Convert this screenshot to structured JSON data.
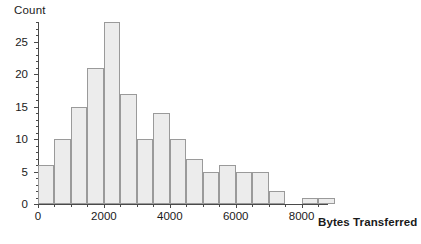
{
  "chart_data": {
    "type": "bar",
    "title": "",
    "ylabel": "Count",
    "xlabel": "Bytes Transferred",
    "grid": false,
    "legend": "none",
    "bin_width": 500,
    "xlim": [
      0,
      8800
    ],
    "ylim": [
      0,
      28
    ],
    "yticks": [
      0,
      5,
      10,
      15,
      20,
      25
    ],
    "ytick_labels": [
      "0",
      "5",
      "10",
      "15",
      "20",
      "25"
    ],
    "y_minor_tick_step": 1,
    "xticks": [
      0,
      2000,
      4000,
      6000,
      8000
    ],
    "xtick_labels": [
      "0",
      "2000",
      "4000",
      "6000",
      "8000"
    ],
    "x_minor_tick_step": 500,
    "bin_starts": [
      0,
      500,
      1000,
      1500,
      2000,
      2500,
      3000,
      3500,
      4000,
      4500,
      5000,
      5500,
      6000,
      6500,
      7000,
      7500,
      8000,
      8500
    ],
    "categories": [
      "0-500",
      "500-1000",
      "1000-1500",
      "1500-2000",
      "2000-2500",
      "2500-3000",
      "3000-3500",
      "3500-4000",
      "4000-4500",
      "4500-5000",
      "5000-5500",
      "5500-6000",
      "6000-6500",
      "6500-7000",
      "7000-7500",
      "7500-8000",
      "8000-8500",
      "8500-9000"
    ],
    "values": [
      6,
      10,
      15,
      21,
      28,
      17,
      10,
      14,
      10,
      7,
      5,
      6,
      5,
      5,
      2,
      0,
      1,
      1
    ],
    "bar_fill_color": "#ececec",
    "bar_border_color": "#9a9a9a",
    "axis_color": "#4a4a4a",
    "background_color": "#ffffff"
  }
}
